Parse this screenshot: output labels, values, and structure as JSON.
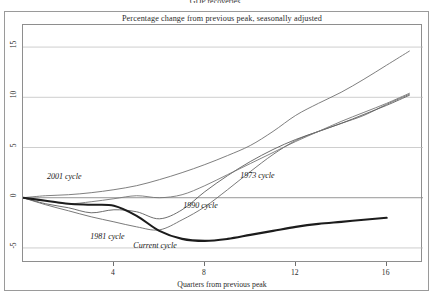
{
  "figure": {
    "cut_off_title": "GDP recoveries",
    "subtitle": "Percentage change from previous peak, seasonally adjusted"
  },
  "axes": {
    "xlabel": "Quarters from previous peak",
    "xticks": [
      "4",
      "8",
      "12",
      "16"
    ],
    "yticks": [
      "15",
      "10",
      "5",
      "0",
      "-5"
    ]
  },
  "chart_data": {
    "type": "line",
    "title": "Percentage change from previous peak, seasonally adjusted",
    "xlabel": "Quarters from previous peak",
    "ylabel": "",
    "xlim": [
      0,
      17.6
    ],
    "ylim": [
      -6.5,
      17.2
    ],
    "yticks": [
      15,
      10,
      5,
      0,
      -5
    ],
    "xticks": [
      4,
      8,
      12,
      16
    ],
    "grid": true,
    "legend_position": "inline-annotations",
    "series": [
      {
        "name": "1973 cycle",
        "color": "#6b6b6b",
        "width": 0.9,
        "label_x": 9.6,
        "label_y": 2.1,
        "x": [
          0,
          1,
          2,
          3,
          4,
          5,
          6,
          7,
          8,
          9,
          10,
          11,
          12,
          13,
          14,
          15,
          16,
          17
        ],
        "y": [
          0,
          -0.7,
          -1.3,
          -1.9,
          -2.4,
          -2.9,
          -3.2,
          -2.2,
          -0.9,
          0.8,
          2.6,
          4.3,
          5.7,
          6.6,
          7.4,
          8.2,
          9.3,
          10.3
        ]
      },
      {
        "name": "1981 cycle",
        "color": "#5d5d5d",
        "width": 0.9,
        "label_x": 3.0,
        "label_y": -4.0,
        "x": [
          0,
          1,
          2,
          3,
          4,
          5,
          6,
          7,
          8,
          9,
          10,
          11,
          12,
          13,
          14,
          15,
          16,
          17
        ],
        "y": [
          0,
          -0.6,
          -1.0,
          -1.5,
          -1.2,
          -1.4,
          -2.1,
          -1.2,
          0.6,
          2.2,
          3.6,
          4.8,
          5.8,
          6.6,
          7.4,
          8.3,
          9.2,
          10.2
        ]
      },
      {
        "name": "1990 cycle",
        "color": "#767676",
        "width": 0.9,
        "label_x": 7.1,
        "label_y": -0.9,
        "x": [
          0,
          1,
          2,
          3,
          4,
          5,
          6,
          7,
          8,
          9,
          10,
          11,
          12,
          13,
          14,
          15,
          16,
          17
        ],
        "y": [
          0,
          -0.3,
          -0.6,
          -0.4,
          -0.1,
          0.2,
          0.0,
          0.3,
          1.2,
          2.3,
          3.4,
          4.5,
          5.6,
          6.6,
          7.6,
          8.5,
          9.4,
          10.4
        ]
      },
      {
        "name": "2001 cycle",
        "color": "#707070",
        "width": 0.9,
        "label_x": 1.1,
        "label_y": 2.0,
        "x": [
          0,
          1,
          2,
          3,
          4,
          5,
          6,
          7,
          8,
          9,
          10,
          11,
          12,
          13,
          14,
          15,
          16,
          17
        ],
        "y": [
          0,
          0.2,
          0.3,
          0.5,
          0.8,
          1.2,
          1.8,
          2.5,
          3.3,
          4.2,
          5.2,
          6.6,
          8.2,
          9.4,
          10.5,
          11.8,
          13.2,
          14.6
        ]
      },
      {
        "name": "Current cycle",
        "color": "#1c1c1c",
        "width": 2.1,
        "label_x": 4.9,
        "label_y": -4.9,
        "x": [
          0,
          1,
          2,
          3,
          4,
          5,
          6,
          7,
          8,
          9,
          10,
          11,
          12,
          13,
          14,
          15,
          16
        ],
        "y": [
          0,
          -0.3,
          -0.6,
          -0.7,
          -0.8,
          -1.8,
          -3.3,
          -4.1,
          -4.3,
          -4.1,
          -3.7,
          -3.3,
          -2.9,
          -2.6,
          -2.4,
          -2.2,
          -2.0
        ]
      }
    ]
  }
}
